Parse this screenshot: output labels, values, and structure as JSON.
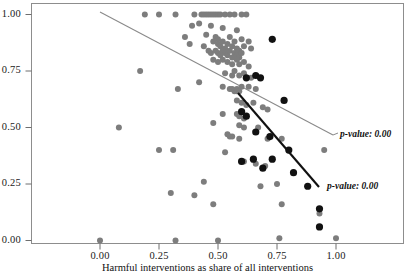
{
  "figure": {
    "width": 415,
    "height": 279,
    "background": "#ffffff"
  },
  "axes": {
    "x_title": "Harmful interventions as share of all interventions",
    "y_title": "",
    "x_ticks": [
      "0.00",
      "0.25",
      "0.50",
      "0.75",
      "1.00"
    ],
    "y_ticks": [
      "0.00",
      "0.25",
      "0.50",
      "0.75",
      "1.00"
    ]
  },
  "annotations": {
    "grey_line_label": "p-value: 0.00",
    "black_line_label": "p-value: 0.00"
  },
  "colors": {
    "grey_points": "#7d7d7d",
    "black_points": "#111111",
    "grey_line": "#8a8a8a",
    "black_line": "#111111",
    "axis": "#6e6e6e",
    "text": "#141414"
  },
  "chart_data": {
    "type": "scatter",
    "title": "",
    "xlabel": "Harmful interventions as share of all interventions",
    "ylabel": "",
    "xlim": [
      -0.17,
      1.14
    ],
    "ylim": [
      -0.04,
      1.04
    ],
    "grid": false,
    "legend": "none",
    "xticks": [
      0.0,
      0.25,
      0.5,
      0.75,
      1.0
    ],
    "yticks": [
      0.0,
      0.25,
      0.5,
      0.75,
      1.0
    ],
    "series": [
      {
        "name": "grey-points",
        "marker": "circle",
        "color": "#7d7d7d",
        "size": 3.0,
        "points": [
          [
            0.19,
            1.0
          ],
          [
            0.25,
            1.0
          ],
          [
            0.32,
            1.0
          ],
          [
            0.4,
            1.0
          ],
          [
            0.43,
            1.0
          ],
          [
            0.44,
            1.0
          ],
          [
            0.45,
            1.0
          ],
          [
            0.46,
            1.0
          ],
          [
            0.47,
            1.0
          ],
          [
            0.48,
            1.0
          ],
          [
            0.49,
            1.0
          ],
          [
            0.5,
            1.0
          ],
          [
            0.51,
            1.0
          ],
          [
            0.53,
            1.0
          ],
          [
            0.55,
            1.0
          ],
          [
            0.57,
            1.0
          ],
          [
            0.6,
            1.0
          ],
          [
            0.62,
            1.0
          ],
          [
            0.39,
            0.95
          ],
          [
            0.42,
            0.96
          ],
          [
            0.47,
            0.95
          ],
          [
            0.52,
            0.94
          ],
          [
            0.58,
            0.93
          ],
          [
            0.36,
            0.9
          ],
          [
            0.45,
            0.91
          ],
          [
            0.49,
            0.9
          ],
          [
            0.5,
            0.89
          ],
          [
            0.55,
            0.9
          ],
          [
            0.6,
            0.89
          ],
          [
            0.63,
            0.88
          ],
          [
            0.38,
            0.87
          ],
          [
            0.44,
            0.86
          ],
          [
            0.48,
            0.88
          ],
          [
            0.5,
            0.87
          ],
          [
            0.51,
            0.86
          ],
          [
            0.52,
            0.88
          ],
          [
            0.53,
            0.85
          ],
          [
            0.54,
            0.87
          ],
          [
            0.56,
            0.86
          ],
          [
            0.57,
            0.88
          ],
          [
            0.58,
            0.85
          ],
          [
            0.59,
            0.84
          ],
          [
            0.61,
            0.86
          ],
          [
            0.64,
            0.85
          ],
          [
            0.46,
            0.84
          ],
          [
            0.47,
            0.83
          ],
          [
            0.49,
            0.84
          ],
          [
            0.5,
            0.83
          ],
          [
            0.51,
            0.82
          ],
          [
            0.52,
            0.84
          ],
          [
            0.53,
            0.83
          ],
          [
            0.54,
            0.82
          ],
          [
            0.55,
            0.84
          ],
          [
            0.56,
            0.81
          ],
          [
            0.57,
            0.83
          ],
          [
            0.58,
            0.82
          ],
          [
            0.59,
            0.81
          ],
          [
            0.6,
            0.83
          ],
          [
            0.48,
            0.8
          ],
          [
            0.5,
            0.79
          ],
          [
            0.52,
            0.8
          ],
          [
            0.54,
            0.79
          ],
          [
            0.56,
            0.78
          ],
          [
            0.58,
            0.8
          ],
          [
            0.59,
            0.78
          ],
          [
            0.61,
            0.79
          ],
          [
            0.63,
            0.77
          ],
          [
            0.17,
            0.75
          ],
          [
            0.53,
            0.74
          ],
          [
            0.56,
            0.73
          ],
          [
            0.57,
            0.75
          ],
          [
            0.59,
            0.73
          ],
          [
            0.61,
            0.74
          ],
          [
            0.64,
            0.72
          ],
          [
            0.33,
            0.67
          ],
          [
            0.42,
            0.7
          ],
          [
            0.52,
            0.68
          ],
          [
            0.55,
            0.67
          ],
          [
            0.56,
            0.67
          ],
          [
            0.57,
            0.66
          ],
          [
            0.58,
            0.67
          ],
          [
            0.58,
            0.66
          ],
          [
            0.59,
            0.66
          ],
          [
            0.6,
            0.68
          ],
          [
            0.63,
            0.68
          ],
          [
            0.66,
            0.67
          ],
          [
            0.58,
            0.62
          ],
          [
            0.6,
            0.61
          ],
          [
            0.62,
            0.6
          ],
          [
            0.65,
            0.61
          ],
          [
            0.69,
            0.59
          ],
          [
            0.71,
            0.58
          ],
          [
            0.52,
            0.56
          ],
          [
            0.58,
            0.56
          ],
          [
            0.59,
            0.55
          ],
          [
            0.61,
            0.54
          ],
          [
            0.48,
            0.52
          ],
          [
            0.59,
            0.51
          ],
          [
            0.61,
            0.5
          ],
          [
            0.67,
            0.5
          ],
          [
            0.08,
            0.5
          ],
          [
            0.54,
            0.47
          ],
          [
            0.55,
            0.46
          ],
          [
            0.56,
            0.46
          ],
          [
            0.59,
            0.45
          ],
          [
            0.71,
            0.45
          ],
          [
            0.77,
            0.45
          ],
          [
            0.25,
            0.4
          ],
          [
            0.31,
            0.4
          ],
          [
            0.53,
            0.39
          ],
          [
            0.95,
            0.4
          ],
          [
            0.6,
            0.35
          ],
          [
            0.61,
            0.35
          ],
          [
            0.66,
            0.34
          ],
          [
            0.7,
            0.33
          ],
          [
            0.44,
            0.26
          ],
          [
            0.68,
            0.24
          ],
          [
            0.75,
            0.25
          ],
          [
            0.3,
            0.21
          ],
          [
            0.4,
            0.2
          ],
          [
            0.48,
            0.16
          ],
          [
            0.77,
            0.16
          ],
          [
            0.93,
            0.12
          ],
          [
            0.0,
            0.0
          ],
          [
            0.32,
            0.0
          ],
          [
            0.5,
            0.0
          ],
          [
            0.76,
            0.01
          ],
          [
            1.0,
            0.01
          ]
        ]
      },
      {
        "name": "black-points",
        "marker": "circle",
        "color": "#111111",
        "size": 3.6,
        "points": [
          [
            0.73,
            0.89
          ],
          [
            0.62,
            0.72
          ],
          [
            0.66,
            0.73
          ],
          [
            0.68,
            0.72
          ],
          [
            0.78,
            0.62
          ],
          [
            0.6,
            0.57
          ],
          [
            0.62,
            0.55
          ],
          [
            0.66,
            0.48
          ],
          [
            0.72,
            0.46
          ],
          [
            0.6,
            0.35
          ],
          [
            0.65,
            0.36
          ],
          [
            0.73,
            0.36
          ],
          [
            0.69,
            0.32
          ],
          [
            0.8,
            0.4
          ],
          [
            0.82,
            0.3
          ],
          [
            0.88,
            0.24
          ],
          [
            0.93,
            0.14
          ],
          [
            0.93,
            0.06
          ]
        ]
      }
    ],
    "fits": [
      {
        "name": "grey-regression",
        "color": "#8a8a8a",
        "width": 1.0,
        "x_start": 0.0,
        "y_start": 1.0,
        "x_end": 0.99,
        "y_end": 0.45,
        "p_value": "0.00"
      },
      {
        "name": "black-regression",
        "color": "#111111",
        "width": 2.0,
        "x_start": 0.59,
        "y_start": 0.64,
        "x_end": 0.93,
        "y_end": 0.18,
        "p_value": "0.00"
      }
    ]
  }
}
